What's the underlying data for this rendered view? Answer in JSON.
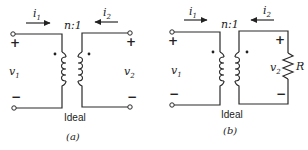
{
  "figures": [
    {
      "id": "a",
      "caption": "(a)",
      "transformer_label": "Ideal",
      "ratio_label": "n:1",
      "current_in": {
        "symbol": "i",
        "sub": "1"
      },
      "current_out": {
        "symbol": "i",
        "sub": "2"
      },
      "voltage_in": {
        "symbol": "v",
        "sub": "1"
      },
      "voltage_out": {
        "symbol": "v",
        "sub": "2"
      },
      "plus": "+",
      "minus": "−",
      "load": null
    },
    {
      "id": "b",
      "caption": "(b)",
      "transformer_label": "Ideal",
      "ratio_label": "n:1",
      "current_in": {
        "symbol": "i",
        "sub": "1"
      },
      "current_out": {
        "symbol": "i",
        "sub": "2"
      },
      "voltage_in": {
        "symbol": "v",
        "sub": "1"
      },
      "voltage_out": {
        "symbol": "v",
        "sub": "2"
      },
      "plus": "+",
      "minus": "−",
      "load": "R"
    }
  ]
}
